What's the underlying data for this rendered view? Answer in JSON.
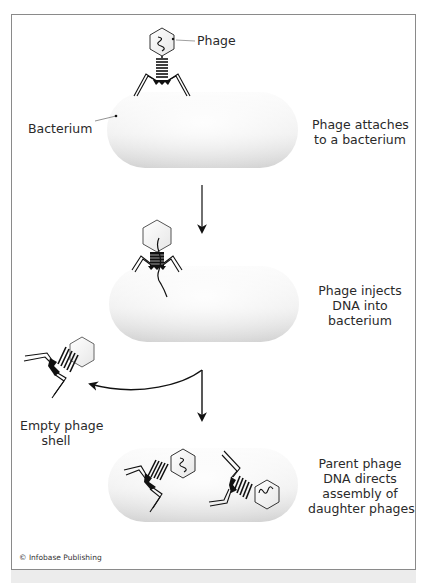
{
  "diagram": {
    "colors": {
      "frame_border": "#8a8a8a",
      "bacterium_light": "#fafafa",
      "bacterium_dark": "#d4d4d4",
      "ink": "#111111",
      "text": "#2a2a2a",
      "bottom_band": "#ececec"
    },
    "labels": {
      "phage": "Phage",
      "bacterium": "Bacterium",
      "empty_shell": [
        "Empty phage",
        "shell"
      ]
    },
    "steps": [
      {
        "id": "attach",
        "caption": [
          "Phage attaches",
          "to a bacterium"
        ]
      },
      {
        "id": "inject",
        "caption": [
          "Phage injects",
          "DNA into",
          "bacterium"
        ]
      },
      {
        "id": "assemble",
        "caption": [
          "Parent phage",
          "DNA directs",
          "assembly of",
          "daughter phages"
        ]
      }
    ],
    "credit": "© Infobase Publishing"
  }
}
